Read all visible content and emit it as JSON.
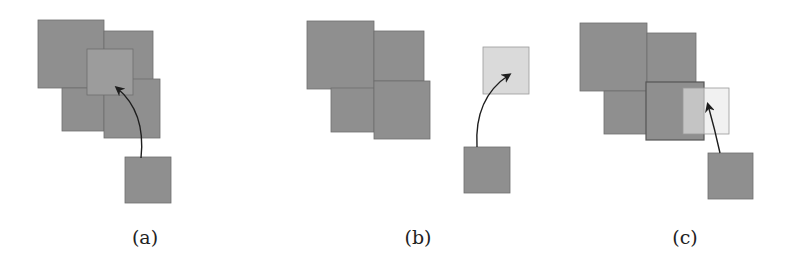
{
  "figure": {
    "width": 785,
    "height": 269,
    "colors": {
      "block": "#8f8f8f",
      "block_border": "#6e6e6e",
      "highlight": "#9c9c9c",
      "light": "#dadada",
      "light_border": "#9a9a9a",
      "arrow": "#1e1e1e"
    },
    "panels": [
      {
        "id": "a",
        "label": "(a)",
        "label_pos": [
          145,
          247
        ],
        "squares": [
          {
            "role": "cluster",
            "x": 38,
            "y": 20,
            "w": 66,
            "h": 68
          },
          {
            "role": "cluster",
            "x": 104,
            "y": 31,
            "w": 49,
            "h": 49
          },
          {
            "role": "cluster",
            "x": 62,
            "y": 88,
            "w": 42,
            "h": 43
          },
          {
            "role": "cluster",
            "x": 104,
            "y": 79,
            "w": 56,
            "h": 59
          },
          {
            "role": "target-overlap",
            "x": 87,
            "y": 49,
            "w": 46,
            "h": 46
          },
          {
            "role": "moving",
            "x": 125,
            "y": 157,
            "w": 46,
            "h": 46
          }
        ],
        "arrow": {
          "start": [
            141,
            158
          ],
          "control": [
            146,
            112
          ],
          "end": [
            117,
            88
          ]
        }
      },
      {
        "id": "b",
        "label": "(b)",
        "label_pos": [
          418,
          247
        ],
        "squares": [
          {
            "role": "cluster",
            "x": 307,
            "y": 21,
            "w": 67,
            "h": 68
          },
          {
            "role": "cluster",
            "x": 374,
            "y": 31,
            "w": 50,
            "h": 50
          },
          {
            "role": "cluster",
            "x": 331,
            "y": 88,
            "w": 43,
            "h": 44
          },
          {
            "role": "cluster",
            "x": 374,
            "y": 81,
            "w": 56,
            "h": 58
          },
          {
            "role": "target-free",
            "x": 483,
            "y": 47,
            "w": 46,
            "h": 47
          },
          {
            "role": "moving",
            "x": 464,
            "y": 147,
            "w": 46,
            "h": 46
          }
        ],
        "arrow": {
          "start": [
            477,
            147
          ],
          "control": [
            474,
            98
          ],
          "end": [
            509,
            75
          ]
        }
      },
      {
        "id": "c",
        "label": "(c)",
        "label_pos": [
          685,
          247
        ],
        "squares": [
          {
            "role": "cluster",
            "x": 580,
            "y": 23,
            "w": 67,
            "h": 68
          },
          {
            "role": "cluster",
            "x": 647,
            "y": 33,
            "w": 49,
            "h": 50
          },
          {
            "role": "cluster",
            "x": 604,
            "y": 91,
            "w": 43,
            "h": 43
          },
          {
            "role": "cluster-outlined",
            "x": 646,
            "y": 82,
            "w": 58,
            "h": 58
          },
          {
            "role": "target-partial",
            "x": 683,
            "y": 88,
            "w": 46,
            "h": 46
          },
          {
            "role": "moving",
            "x": 708,
            "y": 153,
            "w": 45,
            "h": 46
          }
        ],
        "arrow": {
          "start": [
            720,
            153
          ],
          "control": [
            715,
            130
          ],
          "end": [
            708,
            105
          ]
        }
      }
    ]
  }
}
